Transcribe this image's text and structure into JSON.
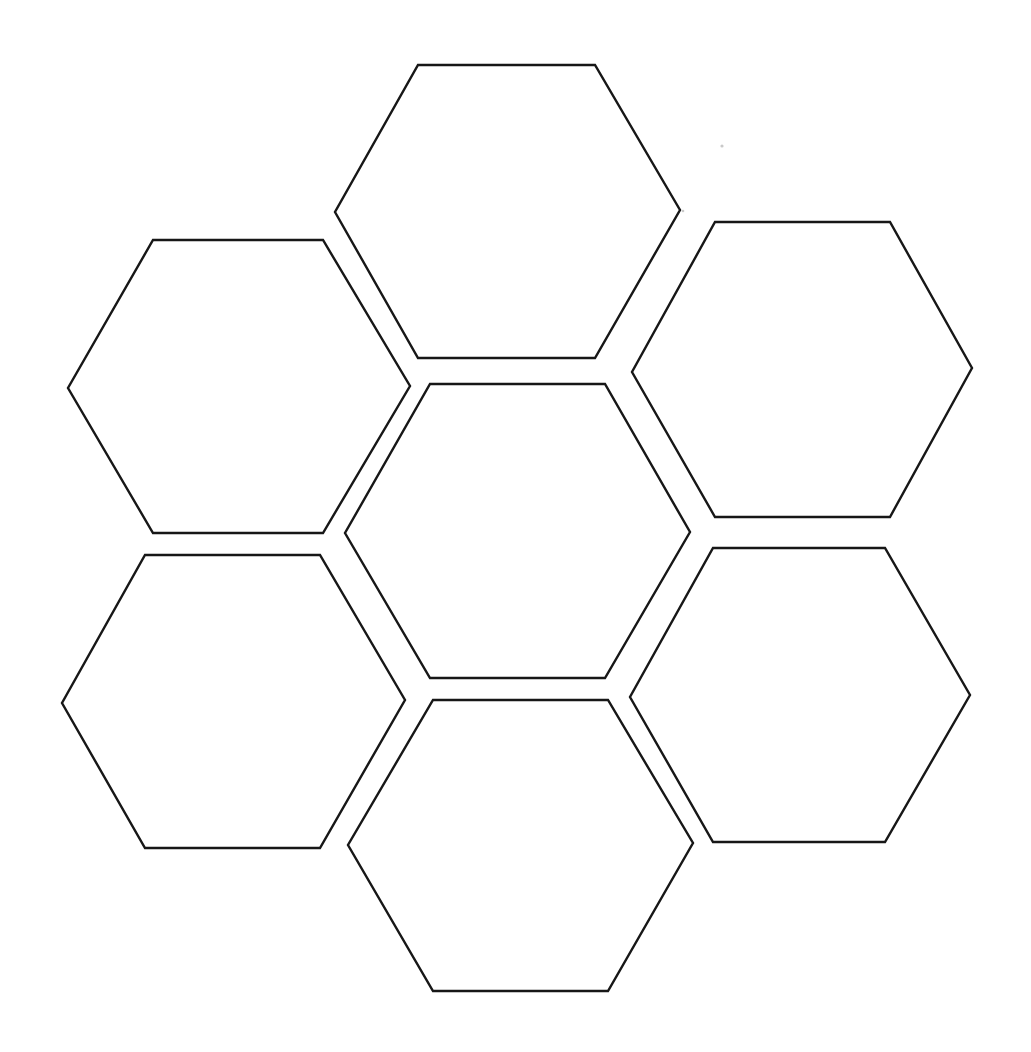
{
  "document": {
    "title": "Hexagon Honeycomb Template",
    "kind": "blank-worksheet",
    "description": "Blank printable hexagon honeycomb template with six empty hexagon cells arranged in a flower/rosette pattern",
    "background_color": "#ffffff",
    "stroke_color": "#171717",
    "fill_color": "#ffffff",
    "stroke_width_px": 2.4,
    "canvas": {
      "width": 1031,
      "height": 1052
    },
    "hexagon_count": 6,
    "orientation": "flat-top",
    "cell_label": ""
  },
  "hexagons": [
    {
      "id": "hex-top-center",
      "name": "Top center hexagon",
      "position": "top-center",
      "label": "",
      "center": {
        "x": 507,
        "y": 211
      },
      "width": 345,
      "height": 293,
      "points": "418,65 595,65 680,210 595,358 418,358 335,212"
    },
    {
      "id": "hex-upper-left",
      "name": "Upper left hexagon",
      "position": "upper-left",
      "label": "",
      "center": {
        "x": 239,
        "y": 387
      },
      "width": 342,
      "height": 293,
      "points": "153,240 323,240 410,386 323,533 153,533 68,388"
    },
    {
      "id": "hex-upper-right",
      "name": "Upper right hexagon",
      "position": "upper-right",
      "label": "",
      "center": {
        "x": 802,
        "y": 370
      },
      "width": 340,
      "height": 295,
      "points": "715,222 890,222 972,368 890,517 715,517 632,372"
    },
    {
      "id": "hex-center",
      "name": "Center hexagon",
      "position": "center",
      "label": "",
      "center": {
        "x": 517,
        "y": 531
      },
      "width": 345,
      "height": 294,
      "points": "430,384 605,384 690,532 605,678 430,678 345,533"
    },
    {
      "id": "hex-lower-left",
      "name": "Lower left hexagon",
      "position": "lower-left",
      "label": "",
      "center": {
        "x": 233,
        "y": 701
      },
      "width": 343,
      "height": 293,
      "points": "145,555 320,555 405,700 320,848 145,848 62,703"
    },
    {
      "id": "hex-lower-right",
      "name": "Lower right hexagon",
      "position": "lower-right",
      "label": "",
      "center": {
        "x": 800,
        "y": 695
      },
      "width": 340,
      "height": 294,
      "points": "713,548 885,548 970,695 885,842 713,842 630,697"
    },
    {
      "id": "hex-bottom-center",
      "name": "Bottom center hexagon",
      "position": "bottom-center",
      "label": "",
      "center": {
        "x": 520,
        "y": 845
      },
      "width": 345,
      "height": 291,
      "points": "433,700 608,700 693,843 608,991 433,991 348,845"
    }
  ],
  "scan_specks": [
    {
      "x": 722,
      "y": 146,
      "r": 1.6
    },
    {
      "x": 683,
      "y": 211,
      "r": 1.3
    },
    {
      "x": 757,
      "y": 282,
      "r": 1.2
    },
    {
      "x": 190,
      "y": 636,
      "r": 1.4
    },
    {
      "x": 450,
      "y": 430,
      "r": 1.1
    },
    {
      "x": 630,
      "y": 600,
      "r": 1.1
    }
  ]
}
